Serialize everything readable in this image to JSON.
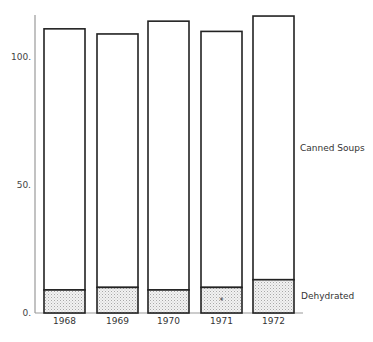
{
  "chart_data": {
    "type": "bar",
    "stacked": true,
    "title": "",
    "xlabel": "",
    "ylabel": "",
    "categories": [
      "1968",
      "1969",
      "1970",
      "1971",
      "1972"
    ],
    "series": [
      {
        "name": "Dehydrated",
        "values": [
          9,
          10,
          9,
          10,
          13
        ],
        "pattern": "dotted"
      },
      {
        "name": "Canned Soups",
        "values": [
          102,
          99,
          105,
          100,
          103
        ],
        "pattern": "none"
      }
    ],
    "totals": [
      111,
      109,
      114,
      110,
      116
    ],
    "yticks": [
      0,
      50,
      100
    ],
    "ytick_labels": [
      "0.",
      "50.",
      "100."
    ],
    "ylim": [
      0,
      117
    ],
    "grid": false,
    "legend_position": "right, inline labels beside last bar",
    "annotations": [
      {
        "category": "1971",
        "series": "Dehydrated",
        "text": "*"
      }
    ]
  },
  "labels": {
    "canned": "Canned Soups",
    "dehydrated": "Dehydrated",
    "asterisk": "*"
  },
  "colors": {
    "bar_outline": "#222222",
    "axis": "#999999",
    "dot_fill": "#bbbbbb"
  }
}
